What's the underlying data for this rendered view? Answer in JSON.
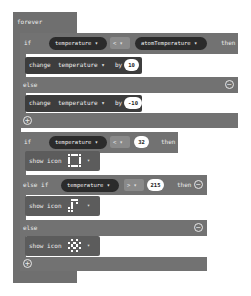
{
  "forever": {
    "label": "forever"
  },
  "if1": {
    "if_label": "if",
    "left_var": "temperature ▾",
    "operator": "< ▾",
    "right_var": "atomTemperature ▾",
    "then_label": "then",
    "then_block": {
      "change_label": "change",
      "var": "temperature ▾",
      "by_label": "by",
      "value": "10"
    },
    "else_label": "else",
    "else_block": {
      "change_label": "change",
      "var": "temperature ▾",
      "by_label": "by",
      "value": "-10"
    },
    "minus_icon": "⊖",
    "plus_icon": "⊕"
  },
  "if2": {
    "if_label": "if",
    "left_var": "temperature ▾",
    "operator": "< ▾",
    "value": "32",
    "then_label": "then",
    "then_block": {
      "label": "show icon",
      "dropdown": "▾",
      "icon": [
        [
          1,
          1,
          1,
          1,
          1
        ],
        [
          1,
          0,
          0,
          0,
          1
        ],
        [
          1,
          0,
          0,
          0,
          1
        ],
        [
          1,
          0,
          0,
          0,
          1
        ],
        [
          1,
          1,
          1,
          1,
          1
        ]
      ]
    },
    "elseif_label": "else if",
    "elseif_var": "temperature ▾",
    "elseif_operator": "> ▾",
    "elseif_value": "215",
    "elseif_then_label": "then",
    "elseif_block": {
      "label": "show icon",
      "dropdown": "▾",
      "icon": [
        [
          0,
          1,
          1,
          1,
          0
        ],
        [
          0,
          1,
          0,
          1,
          0
        ],
        [
          0,
          1,
          0,
          0,
          0
        ],
        [
          1,
          1,
          0,
          0,
          0
        ],
        [
          1,
          1,
          0,
          0,
          0
        ]
      ]
    },
    "else_label": "else",
    "else_block": {
      "label": "show icon",
      "dropdown": "▾",
      "icon": [
        [
          0,
          1,
          0,
          1,
          0
        ],
        [
          1,
          0,
          1,
          0,
          1
        ],
        [
          0,
          1,
          0,
          1,
          0
        ],
        [
          1,
          0,
          1,
          0,
          1
        ],
        [
          0,
          1,
          0,
          1,
          0
        ]
      ]
    },
    "minus_icon": "⊖",
    "plus_icon": "⊕"
  }
}
